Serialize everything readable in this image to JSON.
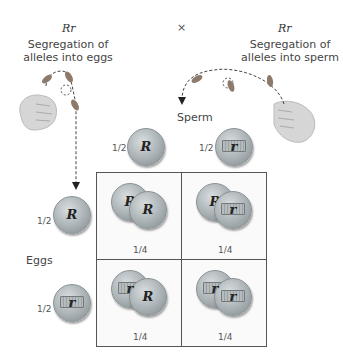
{
  "cross": {
    "left_genotype": "Rr",
    "left_label": "Segregation of alleles into eggs",
    "symbol": "×",
    "right_genotype": "Rr",
    "right_label": "Segregation of alleles into sperm"
  },
  "sperm": {
    "label": "Sperm",
    "gametes": [
      {
        "fraction": "1/2",
        "allele": "R"
      },
      {
        "fraction": "1/2",
        "allele": "r"
      }
    ]
  },
  "eggs": {
    "label": "Eggs",
    "gametes": [
      {
        "fraction": "1/2",
        "allele": "R"
      },
      {
        "fraction": "1/2",
        "allele": "r"
      }
    ]
  },
  "punnett": [
    [
      {
        "egg": "R",
        "sperm": "R",
        "fraction": "1/4"
      },
      {
        "egg": "R",
        "sperm": "r",
        "fraction": "1/4"
      }
    ],
    [
      {
        "egg": "r",
        "sperm": "R",
        "fraction": "1/4"
      },
      {
        "egg": "r",
        "sperm": "r",
        "fraction": "1/4"
      }
    ]
  ]
}
